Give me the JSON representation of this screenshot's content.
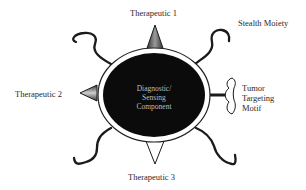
{
  "diagram": {
    "type": "nanoparticle-schematic",
    "core": {
      "label_lines": [
        "Diagnostic/",
        "Sensing",
        "Component"
      ],
      "fill": "#0b0b0b",
      "ring": "#ffffff",
      "outline": "#222222"
    },
    "labels": {
      "therapeutic_1": "Therapeutic 1",
      "therapeutic_2": "Therapeutic 2",
      "therapeutic_3": "Therapeutic 3",
      "stealth": "Stealth Moiety",
      "tumor_lines": [
        "Tumor",
        "Targeting",
        "Motif"
      ]
    },
    "components": [
      {
        "name": "Therapeutic 1",
        "shape": "shaded-triangle",
        "position": "top"
      },
      {
        "name": "Therapeutic 2",
        "shape": "shaded-triangle",
        "position": "left"
      },
      {
        "name": "Therapeutic 3",
        "shape": "outline-triangle",
        "position": "bottom"
      },
      {
        "name": "Stealth Moiety",
        "shape": "wavy-chain",
        "position": "four-diagonals"
      },
      {
        "name": "Tumor Targeting Motif",
        "shape": "bracket-on-stalk",
        "position": "right"
      }
    ]
  }
}
